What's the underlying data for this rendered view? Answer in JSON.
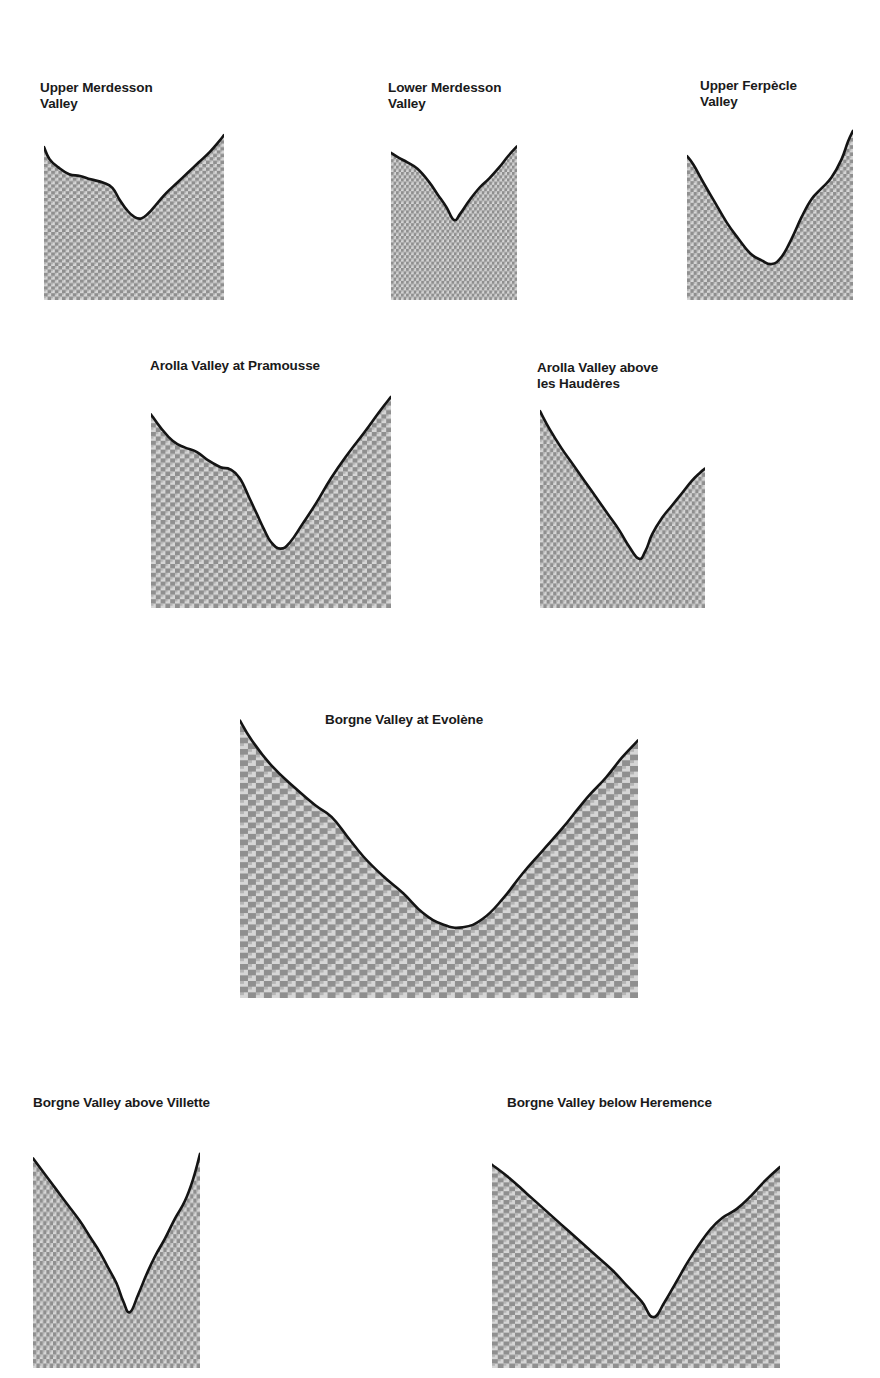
{
  "figure": {
    "title": "",
    "fill_color": "#a8a8a8",
    "line_color": "#141414",
    "background_color": "#ffffff"
  },
  "chart_data": {
    "type": "area",
    "title": "",
    "xlabel": "",
    "ylabel": "",
    "note": "Nine valley cross-section profiles. Each profile is drawn as a filled silhouette; x and y are normalized 0-100 within each panel box, y measured downward from the panel top (0 = panel top / highest ground, 100 = panel bottom).",
    "panels": [
      {
        "id": "upper-merdesson-valley",
        "title": "Upper Merdesson\nValley",
        "title_lines": [
          "Upper Merdesson",
          "Valley"
        ],
        "box": {
          "x": 44,
          "y": 130,
          "w": 180,
          "h": 170
        },
        "title_pos": {
          "x": 40,
          "y": 80
        },
        "x": [
          0,
          3,
          8,
          14,
          20,
          26,
          33,
          38,
          42,
          46,
          50,
          54,
          58,
          63,
          68,
          74,
          80,
          86,
          92,
          97,
          100
        ],
        "y": [
          10,
          17,
          22,
          26,
          27,
          29,
          31,
          34,
          41,
          47,
          51,
          52,
          49,
          43,
          37,
          31,
          25,
          19,
          13,
          7,
          3
        ]
      },
      {
        "id": "lower-merdesson-valley",
        "title": "Lower Merdesson\nValley",
        "title_lines": [
          "Lower Merdesson",
          "Valley"
        ],
        "box": {
          "x": 391,
          "y": 140,
          "w": 126,
          "h": 160
        },
        "title_pos": {
          "x": 388,
          "y": 80
        },
        "x": [
          0,
          6,
          13,
          21,
          30,
          37,
          44,
          50,
          55,
          62,
          70,
          78,
          86,
          93,
          100
        ],
        "y": [
          8,
          11,
          14,
          18,
          26,
          34,
          42,
          50,
          46,
          38,
          30,
          24,
          17,
          10,
          4
        ]
      },
      {
        "id": "upper-ferpecle-valley",
        "title": "Upper Ferpècle\nValley",
        "title_lines": [
          "Upper Ferpècle",
          "Valley"
        ],
        "box": {
          "x": 687,
          "y": 120,
          "w": 166,
          "h": 180
        },
        "title_pos": {
          "x": 700,
          "y": 78
        },
        "x": [
          0,
          4,
          10,
          17,
          24,
          31,
          38,
          45,
          51,
          57,
          63,
          69,
          75,
          81,
          87,
          93,
          97,
          100
        ],
        "y": [
          20,
          25,
          35,
          46,
          57,
          66,
          74,
          78,
          80,
          76,
          66,
          54,
          44,
          38,
          32,
          22,
          12,
          6
        ]
      },
      {
        "id": "arolla-valley-at-pramousse",
        "title": "Arolla Valley at Pramousse",
        "title_lines": [
          "Arolla Valley at Pramousse"
        ],
        "box": {
          "x": 151,
          "y": 388,
          "w": 240,
          "h": 220
        },
        "title_pos": {
          "x": 150,
          "y": 358
        },
        "x": [
          0,
          4,
          9,
          14,
          19,
          24,
          29,
          33,
          37,
          41,
          44,
          47,
          50,
          54,
          58,
          63,
          69,
          75,
          82,
          89,
          95,
          100
        ],
        "y": [
          12,
          18,
          24,
          27,
          29,
          33,
          36,
          37,
          41,
          50,
          57,
          64,
          70,
          73,
          70,
          62,
          52,
          41,
          30,
          20,
          11,
          4
        ]
      },
      {
        "id": "arolla-valley-above-les-hauderes",
        "title": "Arolla Valley above\nles Haudères",
        "title_lines": [
          "Arolla Valley above",
          "les Haudères"
        ],
        "box": {
          "x": 540,
          "y": 403,
          "w": 165,
          "h": 205
        },
        "title_pos": {
          "x": 537,
          "y": 360
        },
        "x": [
          0,
          6,
          13,
          20,
          27,
          34,
          41,
          48,
          54,
          60,
          64,
          68,
          74,
          80,
          86,
          92,
          97,
          100
        ],
        "y": [
          4,
          13,
          22,
          30,
          38,
          46,
          54,
          62,
          70,
          76,
          72,
          64,
          56,
          50,
          44,
          38,
          34,
          32
        ]
      },
      {
        "id": "borgne-valley-at-evolene",
        "title": "Borgne Valley at Evolène",
        "title_lines": [
          "Borgne Valley at Evolène"
        ],
        "box": {
          "x": 240,
          "y": 715,
          "w": 398,
          "h": 283
        },
        "title_pos": {
          "x": 325,
          "y": 712
        },
        "x": [
          0,
          3,
          8,
          14,
          19,
          23,
          27,
          31,
          36,
          41,
          46,
          51,
          56,
          61,
          66,
          71,
          76,
          81,
          85,
          88,
          92,
          96,
          100
        ],
        "y": [
          2,
          9,
          18,
          26,
          32,
          36,
          43,
          50,
          57,
          63,
          70,
          74,
          75,
          72,
          65,
          56,
          48,
          40,
          33,
          28,
          22,
          15,
          9
        ]
      },
      {
        "id": "borgne-valley-above-villette",
        "title": "Borgne Valley above Villette",
        "title_lines": [
          "Borgne Valley above Villette"
        ],
        "box": {
          "x": 33,
          "y": 1145,
          "w": 167,
          "h": 223
        },
        "title_pos": {
          "x": 33,
          "y": 1095
        },
        "x": [
          0,
          7,
          14,
          21,
          28,
          34,
          40,
          45,
          50,
          54,
          58,
          63,
          68,
          73,
          79,
          85,
          91,
          96,
          100
        ],
        "y": [
          6,
          13,
          20,
          27,
          34,
          41,
          48,
          55,
          62,
          70,
          75,
          67,
          58,
          50,
          42,
          33,
          25,
          15,
          4
        ]
      },
      {
        "id": "borgne-valley-below-heremence",
        "title": "Borgne Valley below Heremence",
        "title_lines": [
          "Borgne Valley below Heremence"
        ],
        "box": {
          "x": 492,
          "y": 1147,
          "w": 288,
          "h": 221
        },
        "title_pos": {
          "x": 507,
          "y": 1095
        },
        "x": [
          0,
          6,
          12,
          18,
          24,
          30,
          36,
          42,
          47,
          52,
          56,
          60,
          64,
          68,
          72,
          76,
          80,
          85,
          90,
          95,
          100
        ],
        "y": [
          8,
          14,
          21,
          28,
          35,
          42,
          49,
          56,
          63,
          70,
          77,
          70,
          61,
          52,
          44,
          37,
          32,
          28,
          22,
          15,
          9
        ]
      }
    ]
  }
}
